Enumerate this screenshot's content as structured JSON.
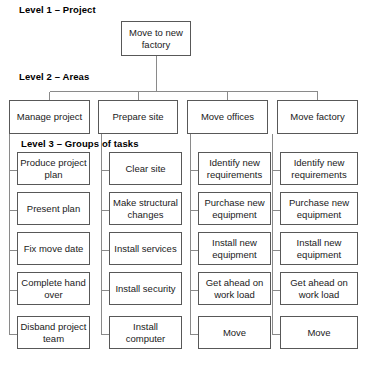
{
  "diagram": {
    "type": "work-breakdown-structure",
    "captions": {
      "level1": "Level 1 – Project",
      "level2": "Level 2 – Areas",
      "level3": "Level 3 – Groups of tasks"
    },
    "root": {
      "label": "Move to new factory"
    },
    "areas": [
      {
        "label": "Manage project",
        "tasks": [
          "Produce project plan",
          "Present plan",
          "Fix move date",
          "Complete hand over",
          "Disband project team"
        ]
      },
      {
        "label": "Prepare site",
        "tasks": [
          "Clear site",
          "Make structural changes",
          "Install services",
          "Install security",
          "Install computer"
        ]
      },
      {
        "label": "Move offices",
        "tasks": [
          "Identify new requirements",
          "Purchase new equipment",
          "Install new equipment",
          "Get ahead on work load",
          "Move"
        ]
      },
      {
        "label": "Move factory",
        "tasks": [
          "Identify new requirements",
          "Purchase new equipment",
          "Install new equipment",
          "Get ahead on work load",
          "Move"
        ]
      }
    ],
    "colors": {
      "background": "#ffffff",
      "box_border": "#585858",
      "connector": "#8a8a8a",
      "text": "#1a1a1a"
    }
  }
}
